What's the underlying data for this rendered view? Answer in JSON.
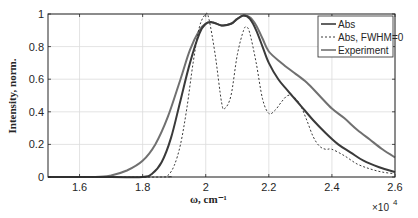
{
  "chart_data": {
    "type": "line",
    "title": "",
    "xlabel": "ω, cm⁻¹",
    "ylabel": "Intensity, norm.",
    "x_exponent_label": "×10",
    "x_exponent_power": "4",
    "xlim": [
      1.5,
      2.6
    ],
    "ylim": [
      0,
      1
    ],
    "xticks": [
      1.6,
      1.8,
      2.0,
      2.2,
      2.4,
      2.6
    ],
    "xtick_labels": [
      "1.6",
      "1.8",
      "2",
      "2.2",
      "2.4",
      "2.6"
    ],
    "yticks": [
      0,
      0.2,
      0.4,
      0.6,
      0.8,
      1
    ],
    "ytick_labels": [
      "0",
      "0.2",
      "0.4",
      "0.6",
      "0.8",
      "1"
    ],
    "grid": true,
    "legend_position": "upper right",
    "series": [
      {
        "name": "Abs",
        "style": "solid",
        "color": "#3a3a3a",
        "width": 2,
        "x": [
          1.5,
          1.7,
          1.8,
          1.83,
          1.86,
          1.89,
          1.92,
          1.95,
          1.98,
          2.0,
          2.02,
          2.05,
          2.08,
          2.1,
          2.12,
          2.14,
          2.16,
          2.18,
          2.2,
          2.23,
          2.26,
          2.3,
          2.34,
          2.38,
          2.42,
          2.46,
          2.5,
          2.55,
          2.6
        ],
        "y": [
          0,
          0,
          0.0,
          0.02,
          0.09,
          0.24,
          0.47,
          0.7,
          0.88,
          0.94,
          0.95,
          0.93,
          0.94,
          0.97,
          0.99,
          0.97,
          0.9,
          0.8,
          0.7,
          0.6,
          0.53,
          0.44,
          0.35,
          0.27,
          0.2,
          0.15,
          0.1,
          0.06,
          0.03
        ]
      },
      {
        "name": "Abs, FWHM=0",
        "style": "dashed",
        "color": "#3a3a3a",
        "width": 1,
        "x": [
          1.5,
          1.86,
          1.88,
          1.9,
          1.92,
          1.94,
          1.96,
          1.98,
          2.0,
          2.01,
          2.03,
          2.05,
          2.06,
          2.08,
          2.1,
          2.12,
          2.13,
          2.14,
          2.16,
          2.18,
          2.2,
          2.22,
          2.24,
          2.26,
          2.28,
          2.3,
          2.32,
          2.34,
          2.36,
          2.38,
          2.4,
          2.44,
          2.48,
          2.52,
          2.56,
          2.6
        ],
        "y": [
          0,
          0,
          0.01,
          0.07,
          0.2,
          0.42,
          0.7,
          0.92,
          1.0,
          0.97,
          0.75,
          0.46,
          0.42,
          0.5,
          0.75,
          0.9,
          0.92,
          0.88,
          0.7,
          0.48,
          0.39,
          0.41,
          0.46,
          0.5,
          0.49,
          0.44,
          0.35,
          0.25,
          0.19,
          0.17,
          0.17,
          0.13,
          0.08,
          0.05,
          0.03,
          0.02
        ]
      },
      {
        "name": "Experiment",
        "style": "solid",
        "color": "#707070",
        "width": 2,
        "x": [
          1.5,
          1.65,
          1.7,
          1.75,
          1.8,
          1.84,
          1.88,
          1.92,
          1.95,
          1.98,
          2.0,
          2.02,
          2.05,
          2.08,
          2.1,
          2.12,
          2.14,
          2.16,
          2.18,
          2.2,
          2.24,
          2.28,
          2.32,
          2.36,
          2.4,
          2.44,
          2.48,
          2.52,
          2.56,
          2.6
        ],
        "y": [
          0,
          0,
          0.01,
          0.04,
          0.1,
          0.2,
          0.37,
          0.6,
          0.78,
          0.9,
          0.94,
          0.95,
          0.93,
          0.94,
          0.97,
          0.99,
          0.98,
          0.93,
          0.85,
          0.77,
          0.7,
          0.64,
          0.58,
          0.5,
          0.42,
          0.36,
          0.29,
          0.23,
          0.17,
          0.12
        ]
      }
    ]
  }
}
